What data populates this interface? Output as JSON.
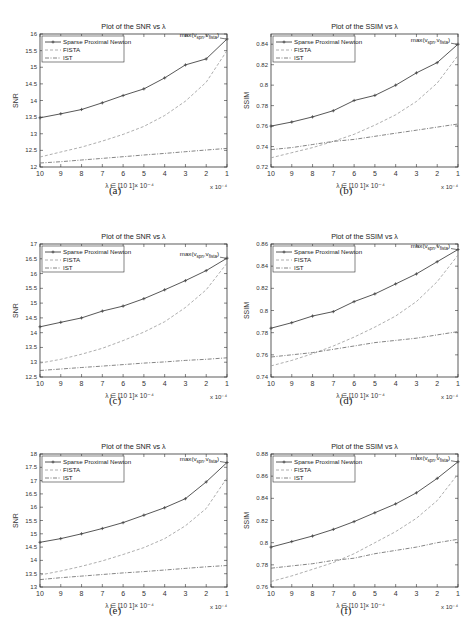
{
  "layout": {
    "rows": 3,
    "cols": 2
  },
  "style": {
    "spn_color": "#444444",
    "fista_color": "#999999",
    "ist_color": "#666666",
    "axis_color": "#333333"
  },
  "chart_data": [
    {
      "id": "a",
      "type": "line",
      "caption": "(a)",
      "title": "Plot of the SNR vs λ",
      "xlabel": "λ ∈ [10 1]× 10⁻⁴",
      "xmult": "x 10⁻⁴",
      "ylabel": "SNR",
      "x": [
        10,
        9,
        8,
        7,
        6,
        5,
        4,
        3,
        2,
        1
      ],
      "xticks": [
        "10",
        "9",
        "8",
        "7",
        "6",
        "5",
        "4",
        "3",
        "2",
        "1"
      ],
      "ylim": [
        12,
        16
      ],
      "yticks": [
        12,
        12.5,
        13,
        13.5,
        14,
        14.5,
        15,
        15.5,
        16
      ],
      "ytick_labels": [
        "12",
        "12.5",
        "13",
        "13.5",
        "14",
        "14.5",
        "15",
        "15.5",
        "16"
      ],
      "legend": [
        "Sparse Proximal Newton",
        "FISTA",
        "IST"
      ],
      "annotation": "max(v_spn, v_fista)",
      "series": [
        {
          "name": "Sparse Proximal Newton",
          "values": [
            13.48,
            13.6,
            13.73,
            13.93,
            14.15,
            14.35,
            14.68,
            15.07,
            15.25,
            15.85
          ]
        },
        {
          "name": "FISTA",
          "values": [
            12.3,
            12.45,
            12.6,
            12.78,
            12.98,
            13.22,
            13.55,
            13.98,
            14.55,
            15.5
          ]
        },
        {
          "name": "IST",
          "values": [
            12.12,
            12.16,
            12.21,
            12.26,
            12.31,
            12.36,
            12.41,
            12.46,
            12.51,
            12.56
          ]
        }
      ]
    },
    {
      "id": "b",
      "type": "line",
      "caption": "(b)",
      "title": "Plot of the SSIM vs λ",
      "xlabel": "λ ∈ [10 1]× 10⁻⁴",
      "xmult": "x 10⁻⁴",
      "ylabel": "SSIM",
      "x": [
        10,
        9,
        8,
        7,
        6,
        5,
        4,
        3,
        2,
        1
      ],
      "xticks": [
        "10",
        "9",
        "8",
        "7",
        "6",
        "5",
        "4",
        "3",
        "2",
        "1"
      ],
      "ylim": [
        0.72,
        0.85
      ],
      "yticks": [
        0.72,
        0.74,
        0.76,
        0.78,
        0.8,
        0.82,
        0.84
      ],
      "ytick_labels": [
        "0.72",
        "0.74",
        "0.76",
        "0.78",
        "0.8",
        "0.82",
        "0.84"
      ],
      "legend": [
        "Sparse Proximal Newton",
        "FISTA",
        "IST"
      ],
      "annotation": "max(v_spn, v_fista)",
      "series": [
        {
          "name": "Sparse Proximal Newton",
          "values": [
            0.76,
            0.764,
            0.769,
            0.775,
            0.785,
            0.79,
            0.8,
            0.812,
            0.822,
            0.84
          ]
        },
        {
          "name": "FISTA",
          "values": [
            0.729,
            0.734,
            0.739,
            0.745,
            0.752,
            0.761,
            0.771,
            0.784,
            0.802,
            0.829
          ]
        },
        {
          "name": "IST",
          "values": [
            0.737,
            0.739,
            0.742,
            0.745,
            0.747,
            0.75,
            0.753,
            0.756,
            0.759,
            0.762
          ]
        }
      ]
    },
    {
      "id": "c",
      "type": "line",
      "caption": "(c)",
      "title": "Plot of the SNR vs λ",
      "xlabel": "λ ∈ [10 1]× 10⁻⁴",
      "xmult": "x 10⁻⁴",
      "ylabel": "SNR",
      "x": [
        10,
        9,
        8,
        7,
        6,
        5,
        4,
        3,
        2,
        1
      ],
      "xticks": [
        "10",
        "9",
        "8",
        "7",
        "6",
        "5",
        "4",
        "3",
        "2",
        "1"
      ],
      "ylim": [
        12.5,
        17
      ],
      "yticks": [
        12.5,
        13,
        13.5,
        14,
        14.5,
        15,
        15.5,
        16,
        16.5,
        17
      ],
      "ytick_labels": [
        "12.5",
        "13",
        "13.5",
        "14",
        "14.5",
        "15",
        "15.5",
        "16",
        "16.5",
        "17"
      ],
      "legend": [
        "Sparse Proximal Newton",
        "FISTA",
        "IST"
      ],
      "annotation": "max(v_spn, v_fista)",
      "series": [
        {
          "name": "Sparse Proximal Newton",
          "values": [
            14.2,
            14.35,
            14.5,
            14.73,
            14.9,
            15.15,
            15.45,
            15.76,
            16.1,
            16.52
          ]
        },
        {
          "name": "FISTA",
          "values": [
            12.97,
            13.1,
            13.27,
            13.47,
            13.73,
            14.02,
            14.37,
            14.85,
            15.45,
            16.35
          ]
        },
        {
          "name": "IST",
          "values": [
            12.72,
            12.77,
            12.82,
            12.87,
            12.92,
            12.97,
            13.01,
            13.06,
            13.1,
            13.15
          ]
        }
      ]
    },
    {
      "id": "d",
      "type": "line",
      "caption": "(d)",
      "title": "Plot of the SSIM vs λ",
      "xlabel": "λ ∈ [10 1]× 10⁻⁴",
      "xmult": "x 10⁻⁴",
      "ylabel": "SSIM",
      "x": [
        10,
        9,
        8,
        7,
        6,
        5,
        4,
        3,
        2,
        1
      ],
      "xticks": [
        "10",
        "9",
        "8",
        "7",
        "6",
        "5",
        "4",
        "3",
        "2",
        "1"
      ],
      "ylim": [
        0.74,
        0.86
      ],
      "yticks": [
        0.74,
        0.76,
        0.78,
        0.8,
        0.82,
        0.84,
        0.86
      ],
      "ytick_labels": [
        "0.74",
        "0.76",
        "0.78",
        "0.8",
        "0.82",
        "0.84",
        "0.86"
      ],
      "legend": [
        "Sparse Proximal Newton",
        "FISTA",
        "IST"
      ],
      "annotation": "max(v_spn, v_fista)",
      "series": [
        {
          "name": "Sparse Proximal Newton",
          "values": [
            0.784,
            0.789,
            0.795,
            0.799,
            0.808,
            0.815,
            0.824,
            0.833,
            0.844,
            0.855
          ]
        },
        {
          "name": "FISTA",
          "values": [
            0.75,
            0.755,
            0.761,
            0.768,
            0.776,
            0.785,
            0.795,
            0.808,
            0.826,
            0.85
          ]
        },
        {
          "name": "IST",
          "values": [
            0.758,
            0.76,
            0.762,
            0.765,
            0.768,
            0.771,
            0.773,
            0.775,
            0.778,
            0.781
          ]
        }
      ]
    },
    {
      "id": "e",
      "type": "line",
      "caption": "(e)",
      "title": "Plot of the SNR vs λ",
      "xlabel": "λ ∈ [10 1]× 10⁻⁴",
      "xmult": "x 10⁻⁴",
      "ylabel": "SNR",
      "x": [
        10,
        9,
        8,
        7,
        6,
        5,
        4,
        3,
        2,
        1
      ],
      "xticks": [
        "10",
        "9",
        "8",
        "7",
        "6",
        "5",
        "4",
        "3",
        "2",
        "1"
      ],
      "ylim": [
        13,
        18
      ],
      "yticks": [
        13,
        13.5,
        14,
        14.5,
        15,
        15.5,
        16,
        16.5,
        17,
        17.5,
        18
      ],
      "ytick_labels": [
        "13",
        "13.5",
        "14",
        "14.5",
        "15",
        "15.5",
        "16",
        "16.5",
        "17",
        "17.5",
        "18"
      ],
      "legend": [
        "Sparse Proximal Newton",
        "FISTA",
        "IST"
      ],
      "annotation": "max(v_spn, v_fista)",
      "series": [
        {
          "name": "Sparse Proximal Newton",
          "values": [
            14.68,
            14.82,
            15.0,
            15.2,
            15.42,
            15.7,
            15.98,
            16.32,
            16.95,
            17.68
          ]
        },
        {
          "name": "FISTA",
          "values": [
            13.45,
            13.6,
            13.78,
            13.98,
            14.22,
            14.48,
            14.82,
            15.3,
            15.95,
            17.1
          ]
        },
        {
          "name": "IST",
          "values": [
            13.28,
            13.35,
            13.41,
            13.47,
            13.53,
            13.58,
            13.64,
            13.7,
            13.76,
            13.81
          ]
        }
      ]
    },
    {
      "id": "f",
      "type": "line",
      "caption": "(f)",
      "title": "Plot of the SSIM vs λ",
      "xlabel": "λ ∈ [10 1]× 10⁻⁴",
      "xmult": "x 10⁻⁴",
      "ylabel": "SSIM",
      "x": [
        10,
        9,
        8,
        7,
        6,
        5,
        4,
        3,
        2,
        1
      ],
      "xticks": [
        "10",
        "9",
        "8",
        "7",
        "6",
        "5",
        "4",
        "3",
        "2",
        "1"
      ],
      "ylim": [
        0.76,
        0.88
      ],
      "yticks": [
        0.76,
        0.78,
        0.8,
        0.82,
        0.84,
        0.86,
        0.88
      ],
      "ytick_labels": [
        "0.76",
        "0.78",
        "0.8",
        "0.82",
        "0.84",
        "0.86",
        "0.88"
      ],
      "legend": [
        "Sparse Proximal Newton",
        "FISTA",
        "IST"
      ],
      "annotation": "max(v_spn, v_fista)",
      "series": [
        {
          "name": "Sparse Proximal Newton",
          "values": [
            0.796,
            0.801,
            0.806,
            0.812,
            0.819,
            0.827,
            0.835,
            0.845,
            0.858,
            0.873
          ]
        },
        {
          "name": "FISTA",
          "values": [
            0.765,
            0.77,
            0.776,
            0.782,
            0.79,
            0.8,
            0.81,
            0.822,
            0.838,
            0.862
          ]
        },
        {
          "name": "IST",
          "values": [
            0.777,
            0.779,
            0.781,
            0.784,
            0.786,
            0.79,
            0.793,
            0.796,
            0.8,
            0.803
          ]
        }
      ]
    }
  ]
}
